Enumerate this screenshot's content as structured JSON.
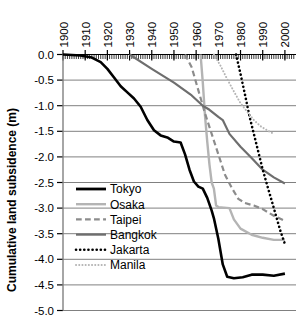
{
  "chart_data": {
    "type": "line",
    "title": "",
    "xlabel": "",
    "ylabel": "Cumulative land subsidence (m)",
    "xlim": [
      1900,
      2005
    ],
    "ylim": [
      -5.0,
      0.0
    ],
    "grid": true,
    "x_axis_position": "top",
    "legend_position": "inside-left-lower",
    "xticks": [
      1900,
      1910,
      1920,
      1930,
      1940,
      1950,
      1960,
      1970,
      1980,
      1990,
      2000
    ],
    "xticklabels": [
      "1900",
      "1910",
      "1920",
      "1930",
      "1940",
      "1950",
      "1960",
      "1970",
      "1980",
      "1990",
      "2000"
    ],
    "yticks": [
      0.0,
      -0.5,
      -1.0,
      -1.5,
      -2.0,
      -2.5,
      -3.0,
      -3.5,
      -4.0,
      -4.5,
      -5.0
    ],
    "yticklabels": [
      "0.0",
      "-0.5",
      "-1.0",
      "-1.5",
      "-2.0",
      "-2.5",
      "-3.0",
      "-3.5",
      "-4.0",
      "-4.5",
      "-5.0"
    ],
    "minor_xticks": true,
    "series": [
      {
        "name": "Tokyo",
        "color": "#000000",
        "style": "solid",
        "width": 2.6,
        "points": [
          [
            1900,
            0.0
          ],
          [
            1908,
            -0.02
          ],
          [
            1913,
            -0.06
          ],
          [
            1917,
            -0.15
          ],
          [
            1920,
            -0.28
          ],
          [
            1923,
            -0.45
          ],
          [
            1926,
            -0.62
          ],
          [
            1929,
            -0.74
          ],
          [
            1932,
            -0.86
          ],
          [
            1935,
            -1.02
          ],
          [
            1938,
            -1.28
          ],
          [
            1941,
            -1.48
          ],
          [
            1944,
            -1.58
          ],
          [
            1947,
            -1.62
          ],
          [
            1950,
            -1.7
          ],
          [
            1953,
            -1.72
          ],
          [
            1955,
            -1.95
          ],
          [
            1957,
            -2.25
          ],
          [
            1959,
            -2.48
          ],
          [
            1961,
            -2.58
          ],
          [
            1963,
            -2.62
          ],
          [
            1965,
            -2.8
          ],
          [
            1967,
            -3.05
          ],
          [
            1968,
            -3.2
          ],
          [
            1970,
            -3.6
          ],
          [
            1972,
            -4.1
          ],
          [
            1974,
            -4.34
          ],
          [
            1977,
            -4.37
          ],
          [
            1981,
            -4.35
          ],
          [
            1985,
            -4.3
          ],
          [
            1990,
            -4.3
          ],
          [
            1995,
            -4.32
          ],
          [
            2000,
            -4.28
          ]
        ]
      },
      {
        "name": "Osaka",
        "color": "#b4b4b4",
        "style": "solid",
        "width": 2.4,
        "points": [
          [
            1962,
            0.0
          ],
          [
            1963,
            -0.55
          ],
          [
            1964,
            -1.2
          ],
          [
            1965,
            -1.7
          ],
          [
            1966,
            -2.15
          ],
          [
            1967,
            -2.5
          ],
          [
            1968,
            -2.62
          ],
          [
            1969,
            -2.95
          ],
          [
            1970,
            -2.98
          ],
          [
            1975,
            -3.0
          ],
          [
            1977,
            -3.22
          ],
          [
            1980,
            -3.4
          ],
          [
            1985,
            -3.52
          ],
          [
            1990,
            -3.58
          ],
          [
            1995,
            -3.62
          ],
          [
            2000,
            -3.62
          ]
        ]
      },
      {
        "name": "Taipei",
        "color": "#8c8c8c",
        "style": "dashed",
        "width": 2.2,
        "points": [
          [
            1955,
            0.0
          ],
          [
            1958,
            -0.25
          ],
          [
            1961,
            -0.7
          ],
          [
            1964,
            -1.15
          ],
          [
            1967,
            -1.55
          ],
          [
            1970,
            -1.95
          ],
          [
            1973,
            -2.35
          ],
          [
            1976,
            -2.6
          ],
          [
            1979,
            -2.82
          ],
          [
            1982,
            -2.9
          ],
          [
            1986,
            -2.95
          ],
          [
            1990,
            -3.02
          ],
          [
            1995,
            -3.15
          ],
          [
            2000,
            -3.25
          ]
        ]
      },
      {
        "name": "Bangkok",
        "color": "#6e6e6e",
        "style": "solid",
        "width": 2.2,
        "points": [
          [
            1930,
            0.0
          ],
          [
            1940,
            -0.28
          ],
          [
            1950,
            -0.55
          ],
          [
            1958,
            -0.8
          ],
          [
            1963,
            -1.0
          ],
          [
            1966,
            -1.08
          ],
          [
            1970,
            -1.22
          ],
          [
            1972,
            -1.28
          ],
          [
            1975,
            -1.55
          ],
          [
            1980,
            -1.8
          ],
          [
            1985,
            -2.02
          ],
          [
            1990,
            -2.25
          ],
          [
            1995,
            -2.4
          ],
          [
            2000,
            -2.52
          ]
        ]
      },
      {
        "name": "Jakarta",
        "color": "#000000",
        "style": "dotted",
        "width": 2.6,
        "points": [
          [
            1978,
            0.0
          ],
          [
            1980,
            -0.38
          ],
          [
            1982,
            -0.78
          ],
          [
            1984,
            -1.2
          ],
          [
            1986,
            -1.55
          ],
          [
            1988,
            -1.9
          ],
          [
            1990,
            -2.25
          ],
          [
            1992,
            -2.55
          ],
          [
            1994,
            -2.85
          ],
          [
            1996,
            -3.15
          ],
          [
            1998,
            -3.45
          ],
          [
            2000,
            -3.7
          ]
        ]
      },
      {
        "name": "Manila",
        "color": "#b4b4b4",
        "style": "dotted",
        "width": 2.0,
        "points": [
          [
            1968,
            0.0
          ],
          [
            1971,
            -0.22
          ],
          [
            1974,
            -0.48
          ],
          [
            1977,
            -0.72
          ],
          [
            1980,
            -0.95
          ],
          [
            1983,
            -1.12
          ],
          [
            1986,
            -1.28
          ],
          [
            1989,
            -1.4
          ],
          [
            1992,
            -1.48
          ],
          [
            1995,
            -1.55
          ]
        ]
      }
    ],
    "legend": [
      {
        "label": "Tokyo",
        "color": "#000000",
        "style": "solid",
        "width": 2.8
      },
      {
        "label": "Osaka",
        "color": "#b4b4b4",
        "style": "solid",
        "width": 2.4
      },
      {
        "label": "Taipei",
        "color": "#8c8c8c",
        "style": "dashed",
        "width": 2.2
      },
      {
        "label": "Bangkok",
        "color": "#6e6e6e",
        "style": "solid",
        "width": 2.2
      },
      {
        "label": "Jakarta",
        "color": "#000000",
        "style": "dotted",
        "width": 2.6
      },
      {
        "label": "Manila",
        "color": "#b4b4b4",
        "style": "dotted",
        "width": 2.0
      }
    ]
  }
}
